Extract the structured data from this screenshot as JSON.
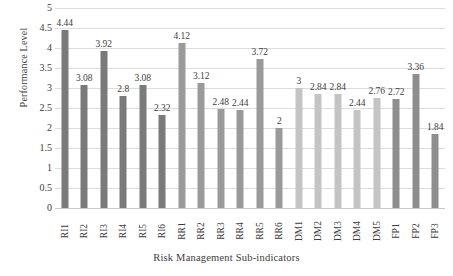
{
  "chart_data": {
    "type": "bar",
    "title": "",
    "xlabel": "Risk Management Sub-indicators",
    "ylabel": "Performance Level",
    "ylim": [
      0,
      5
    ],
    "ytick_step": 0.5,
    "ytick_labels": [
      "5",
      "4.5",
      "4",
      "3.5",
      "3",
      "2.5",
      "2",
      "1.5",
      "1",
      "0.5",
      "0"
    ],
    "grid": true,
    "legend": "none",
    "categories": [
      "RI1",
      "RI2",
      "RI3",
      "RI4",
      "RI5",
      "RI6",
      "RR1",
      "RR2",
      "RR3",
      "RR4",
      "RR5",
      "RR6",
      "DM1",
      "DM2",
      "DM3",
      "DM4",
      "DM5",
      "FP1",
      "FP2",
      "FP3"
    ],
    "values": [
      4.44,
      3.08,
      3.92,
      2.8,
      3.08,
      2.32,
      4.12,
      3.12,
      2.48,
      2.44,
      3.72,
      2,
      3,
      2.84,
      2.84,
      2.44,
      2.76,
      2.72,
      3.36,
      1.84
    ],
    "value_labels": [
      "4.44",
      "3.08",
      "3.92",
      "2.8",
      "3.08",
      "2.32",
      "4.12",
      "3.12",
      "2.48",
      "2.44",
      "3.72",
      "2",
      "3",
      "2.84",
      "2.84",
      "2.44",
      "2.76",
      "2.72",
      "3.36",
      "1.84"
    ],
    "bar_colors": [
      "#7a7a7a",
      "#7a7a7a",
      "#7a7a7a",
      "#7a7a7a",
      "#7a7a7a",
      "#7a7a7a",
      "#9a9a9a",
      "#9a9a9a",
      "#9a9a9a",
      "#9a9a9a",
      "#9a9a9a",
      "#9a9a9a",
      "#c4c4c4",
      "#c4c4c4",
      "#c4c4c4",
      "#c4c4c4",
      "#c4c4c4",
      "#8e8e8e",
      "#8e8e8e",
      "#8e8e8e"
    ],
    "groups": [
      {
        "name": "RI",
        "color": "#7a7a7a",
        "count": 6
      },
      {
        "name": "RR",
        "color": "#9a9a9a",
        "count": 6
      },
      {
        "name": "DM",
        "color": "#c4c4c4",
        "count": 5
      },
      {
        "name": "FP",
        "color": "#8e8e8e",
        "count": 3
      }
    ],
    "axis_color": "#dcdcdc",
    "text_color": "#3d3d3d"
  }
}
